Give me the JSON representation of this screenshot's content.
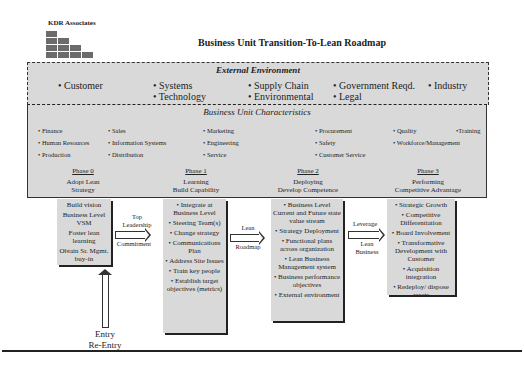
{
  "header": {
    "company": "KDR Associates",
    "title": "Business Unit Transition-To-Lean Roadmap"
  },
  "external_environment": {
    "title": "External Environment",
    "items": [
      "• Customer",
      "• Systems",
      "• Technology",
      "• Supply Chain",
      "• Environmental",
      "• Government Reqd.",
      "• Legal",
      "• Industry"
    ]
  },
  "business_unit": {
    "title": "Business Unit Characteristics",
    "columns": [
      [
        "• Finance",
        "• Human Resources",
        "• Production"
      ],
      [
        "• Sales",
        "• Information Systems",
        "• Distribution"
      ],
      [
        "• Marketing",
        "• Engineering",
        "• Service"
      ],
      [
        "• Procurement",
        "• Safety",
        "• Customer Service"
      ],
      [
        "• Quality",
        "• Workforce/Management"
      ],
      [
        "•Training"
      ]
    ]
  },
  "phases": [
    {
      "name": "Phase 0",
      "line1": "Adopt Lean",
      "line2": "Strategy"
    },
    {
      "name": "Phase 1",
      "line1": "Learning",
      "line2": "Build Capability"
    },
    {
      "name": "Phase 2",
      "line1": "Deploying",
      "line2": "Develop Competence"
    },
    {
      "name": "Phase 3",
      "line1": "Performing",
      "line2": "Competitive Advantage"
    }
  ],
  "boxes": {
    "phase0": [
      "Build vision",
      "Business Level VSM",
      "Foster lean learning",
      "Obtain Sr. Mgmt. buy-in"
    ],
    "phase1": [
      "• Integrate at Business Level",
      "• Steering Team(s)",
      "• Change strategy",
      "• Communications Plan",
      "• Address Site Issues",
      "• Train key people",
      "• Establish target objectives (metrics)"
    ],
    "phase2": [
      "• Business Level Current and Future state value stream",
      "• Strategy Deployment",
      "• Functional plans across organization",
      "• Lean Business Management system",
      "• Business performance objectives",
      "• External environment"
    ],
    "phase3": [
      "• Strategic Growth",
      "• Competitive Differentiation",
      "• Board Involvement",
      "• Transformative Development with Customer",
      "• Acquisition integration",
      "• Redeploy/ dispose assets"
    ]
  },
  "arrows": {
    "a1_top": "Top Leadership",
    "a1_bottom": "Commitment",
    "a2_top": "Lean",
    "a2_bottom": "Roadmap",
    "a3_top": "Leverage",
    "a3_bottom": "Lean Business"
  },
  "entry": {
    "line1": "Entry",
    "line2": "Re-Entry"
  }
}
